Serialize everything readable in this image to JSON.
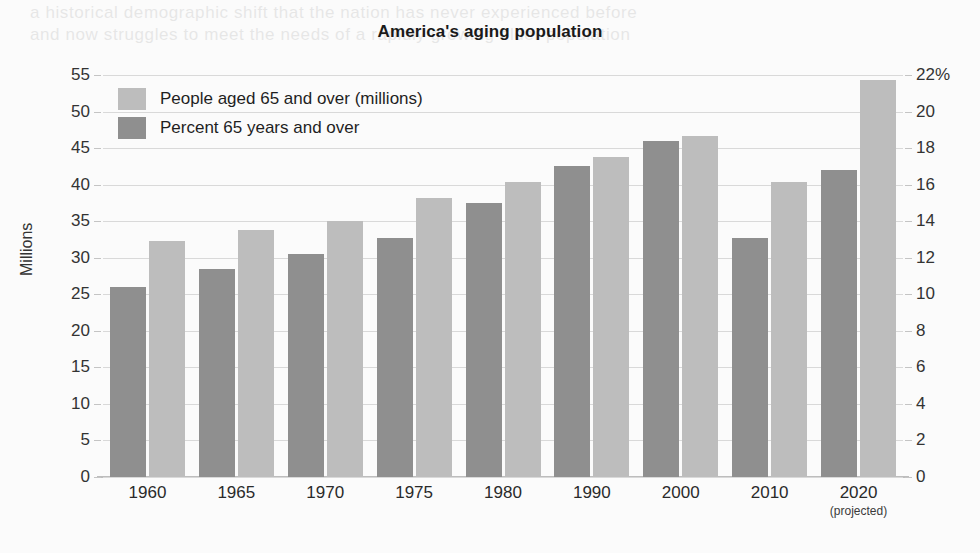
{
  "page": {
    "bleed_text_line1": "a historical demographic shift that the nation has never experienced before",
    "bleed_text_line2": "and now struggles to meet the needs of a rapidly growing older population"
  },
  "chart_data": {
    "type": "bar",
    "title": "America's aging population",
    "xlabel": "",
    "ylabel": "Millions",
    "ylabel_right": "",
    "categories": [
      "1960",
      "1965",
      "1970",
      "1975",
      "1980",
      "1990",
      "2000",
      "2010",
      "2020"
    ],
    "category_notes": [
      "",
      "",
      "",
      "",
      "",
      "",
      "",
      "",
      "(projected)"
    ],
    "series": [
      {
        "name": "People aged 65 and over (millions)",
        "axis": "left",
        "color": "#bdbdbd",
        "values": [
          32.3,
          33.8,
          35.0,
          38.2,
          40.4,
          43.8,
          46.6,
          40.4,
          54.3
        ]
      },
      {
        "name": "Percent 65 years and over",
        "axis": "right",
        "color": "#8f8f8f",
        "values": [
          10.4,
          11.4,
          12.2,
          13.1,
          15.0,
          17.0,
          18.4,
          13.1,
          16.8
        ]
      }
    ],
    "left_axis": {
      "min": 0,
      "max": 55,
      "step": 5,
      "ticks": [
        "0",
        "5",
        "10",
        "15",
        "20",
        "25",
        "30",
        "35",
        "40",
        "45",
        "50",
        "55"
      ]
    },
    "right_axis": {
      "min": 0,
      "max": 22,
      "step": 2,
      "ticks": [
        "0",
        "2",
        "4",
        "6",
        "8",
        "10",
        "12",
        "14",
        "16",
        "18",
        "20",
        "22%"
      ]
    },
    "legend_position": "top-left",
    "grid": true
  }
}
